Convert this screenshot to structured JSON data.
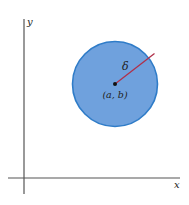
{
  "diagram": {
    "axes": {
      "x_label": "x",
      "y_label": "y",
      "color": "#555555"
    },
    "disk": {
      "center_label": "(a, b)",
      "radius_label": "δ",
      "fill_color": "#6fa1dd",
      "border_color": "#2f7cc8",
      "radius_color": "#b0304a",
      "center_dot_color": "#111111"
    }
  }
}
